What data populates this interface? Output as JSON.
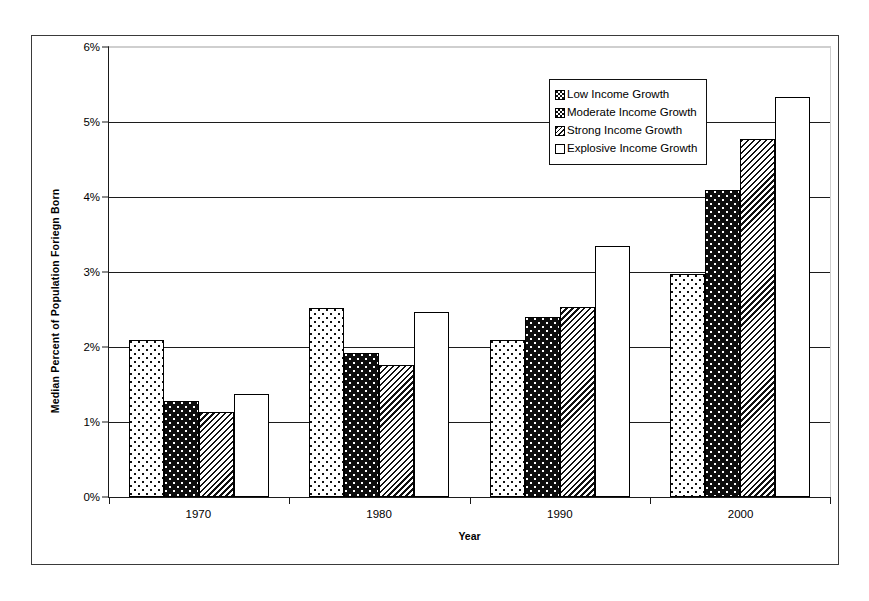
{
  "chart_data": {
    "type": "bar",
    "title": "",
    "xlabel": "Year",
    "ylabel": "Median Percent of Population Foriegn Born",
    "categories": [
      "1970",
      "1980",
      "1990",
      "2000"
    ],
    "ylim": [
      0,
      6
    ],
    "ytick_labels": [
      "0%",
      "1%",
      "2%",
      "3%",
      "4%",
      "5%",
      "6%"
    ],
    "ytick_values": [
      0,
      1,
      2,
      3,
      4,
      5,
      6
    ],
    "grid": true,
    "legend_position": "top-right",
    "series": [
      {
        "name": "Low Income Growth",
        "pattern": "pat-low",
        "values": [
          2.1,
          2.52,
          2.1,
          2.97
        ]
      },
      {
        "name": "Moderate Income Growth",
        "pattern": "pat-moderate",
        "values": [
          1.28,
          1.92,
          2.4,
          4.1
        ]
      },
      {
        "name": "Strong Income Growth",
        "pattern": "pat-strong",
        "values": [
          1.13,
          1.76,
          2.53,
          4.77
        ]
      },
      {
        "name": "Explosive Income Growth",
        "pattern": "pat-explosive",
        "values": [
          1.38,
          2.47,
          3.35,
          5.33
        ]
      }
    ]
  }
}
